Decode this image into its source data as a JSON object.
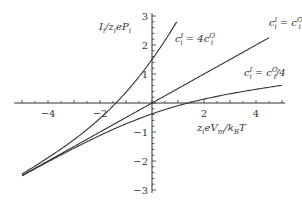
{
  "chart_data": {
    "type": "line",
    "title": "",
    "xlabel": "z_i e V_m / k_B T",
    "ylabel": "I_i / z_i e P_i",
    "xlim": [
      -5.3,
      5.0
    ],
    "ylim": [
      -3.1,
      3.1
    ],
    "x_ticks": [
      -4,
      -2,
      2,
      4
    ],
    "y_ticks": [
      -3,
      -2,
      -1,
      1,
      2,
      3
    ],
    "x_minor_step": 0.5,
    "y_minor_step": 0.2,
    "grid": false,
    "legend": "inline annotations",
    "series": [
      {
        "name": "c_i^I = 4c_i^O",
        "concentration_ratio": 4,
        "x": [
          -5,
          -4,
          -3,
          -2,
          -1.39,
          -1,
          0,
          0.5,
          0.95
        ],
        "values": [
          -2.45,
          -1.93,
          -1.43,
          -0.78,
          0,
          0.55,
          1.5,
          2.23,
          3.0
        ]
      },
      {
        "name": "c_i^I = c_i^O",
        "concentration_ratio": 1,
        "x": [
          -5,
          -4,
          -2,
          0,
          2,
          4,
          4.5
        ],
        "values": [
          -2.5,
          -2.0,
          -1.0,
          0,
          1.0,
          2.0,
          2.25
        ]
      },
      {
        "name": "c_i^I = c_i^O/4",
        "concentration_ratio": 0.25,
        "x": [
          -5,
          -4,
          -2,
          0,
          1.39,
          2,
          4,
          5
        ],
        "values": [
          -2.5,
          -1.99,
          -0.97,
          -0.375,
          0,
          0.17,
          0.49,
          0.61
        ]
      }
    ],
    "annotations": [
      {
        "id": "ylabel",
        "text": "I_i/z_i e P_i"
      },
      {
        "id": "xlabel",
        "text": "z_i e V_m/k_B T"
      },
      {
        "id": "ratio4",
        "text": "c_i^I = 4c_i^O"
      },
      {
        "id": "ratio1",
        "text": "c_i^I = c_i^O"
      },
      {
        "id": "ratio025",
        "text": "c_i^I = c_i^O/4"
      }
    ]
  },
  "labels": {
    "ylabel_main": "I",
    "ylabel_sub1": "i",
    "ylabel_mid": "/z",
    "ylabel_sub2": "i",
    "ylabel_end": "eP",
    "ylabel_sub3": "i",
    "xlabel_z": "z",
    "xlabel_sub1": "i",
    "xlabel_mid": "eV",
    "xlabel_sub2": "m",
    "xlabel_k": "/k",
    "xlabel_sub3": "B",
    "xlabel_end": "T",
    "ann4_c": "c",
    "ann4_sup": "I",
    "ann4_sub": "i",
    "ann4_eq": " = 4c",
    "ann4_sup2": "O",
    "ann4_sub2": "i",
    "ann1_c": "c",
    "ann1_sup": "I",
    "ann1_sub": "i",
    "ann1_eq": " = c",
    "ann1_sup2": "O",
    "ann1_sub2": "i",
    "ann025_c": "c",
    "ann025_sup": "I",
    "ann025_sub": "i",
    "ann025_eq": " = c",
    "ann025_sup2": "O",
    "ann025_sub2": "i",
    "ann025_tail": "/4"
  },
  "colors": {
    "axis": "#333333",
    "curve": "#333333",
    "text": "#333333",
    "background": "#ffffff"
  },
  "geometry": {
    "origin_px": [
      152,
      103
    ],
    "px_per_x": 26,
    "px_per_y": 29
  }
}
